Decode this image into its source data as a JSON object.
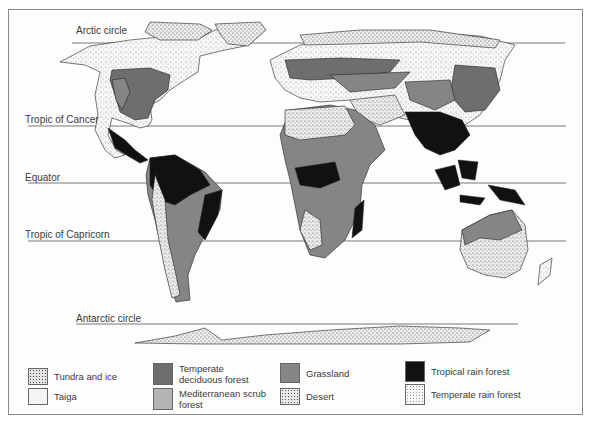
{
  "map": {
    "type": "world-biome-map",
    "latitude_lines": [
      {
        "label": "Arctic circle",
        "y": 43
      },
      {
        "label": "Tropic of Cancer",
        "y": 126
      },
      {
        "label": "Equator",
        "y": 183
      },
      {
        "label": "Tropic of Capricorn",
        "y": 241
      },
      {
        "label": "Antarctic circle",
        "y": 324
      }
    ]
  },
  "legend": {
    "items": [
      {
        "label": "Tundra and ice",
        "pattern": "dense-stipple",
        "color": "#e8e8e8"
      },
      {
        "label": "Taiga",
        "pattern": "light-stipple",
        "color": "#f2f2f2"
      },
      {
        "label": "Temperate deciduous forest",
        "pattern": "solid",
        "color": "#6e6e6e"
      },
      {
        "label": "Mediterranean scrub forest",
        "pattern": "solid",
        "color": "#b4b4b4"
      },
      {
        "label": "Grassland",
        "pattern": "solid",
        "color": "#858585"
      },
      {
        "label": "Desert",
        "pattern": "medium-stipple",
        "color": "#e0e0e0"
      },
      {
        "label": "Tropical rain forest",
        "pattern": "solid",
        "color": "#111111"
      },
      {
        "label": "Temperate rain forest",
        "pattern": "fine-stipple",
        "color": "#f5f5f5"
      }
    ]
  }
}
